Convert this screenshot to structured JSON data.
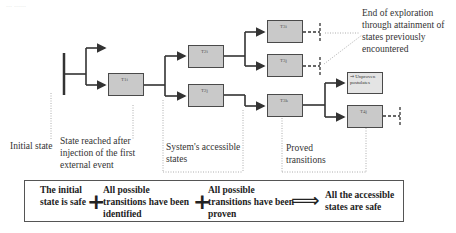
{
  "diagram": {
    "title_fragment": "... ......",
    "nodes": [
      {
        "id": "T1i",
        "label": "T1i"
      },
      {
        "id": "T2i",
        "label": "T2i"
      },
      {
        "id": "T2j",
        "label": "T2j"
      },
      {
        "id": "T3i",
        "label": "T3i"
      },
      {
        "id": "T3j",
        "label": "T3j"
      },
      {
        "id": "T3k",
        "label": "T3k"
      },
      {
        "id": "T4j",
        "label": "T4j"
      },
      {
        "id": "unproven",
        "label": "⇒ Unproven postulates"
      }
    ],
    "annotations": {
      "initial_state": "Initial state",
      "state_reached": "State reached after injection of the first external event",
      "accessible_states": "System's accessible states",
      "proved_transitions": "Proved transitions",
      "end_of_exploration": "End of exploration through attainment of states previously encountered"
    },
    "summary": {
      "term1": "The initial state is safe",
      "op1": "+",
      "term2": "All possible transitions have been identified",
      "op2": "+",
      "term3": "All possible transitions have been proven",
      "implies": "⟹",
      "conclusion": "All the accessible states are safe"
    },
    "colors": {
      "box_fill": "#c9c9c9",
      "box_border": "#4a4a4a",
      "line": "#333333",
      "dotted": "#999999"
    }
  }
}
